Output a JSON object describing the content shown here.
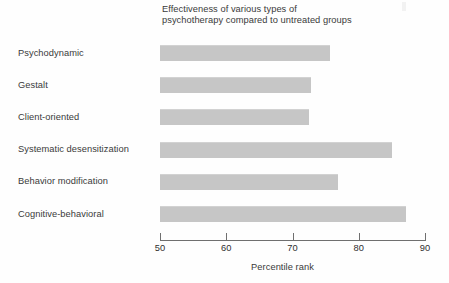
{
  "chart_data": {
    "type": "bar",
    "orientation": "horizontal",
    "title": "Effectiveness of various types of psychotherapy compared to untreated groups",
    "title_line1": "Effectiveness of various types of",
    "title_line2": "psychotherapy compared to untreated groups",
    "xlabel": "Percentile rank",
    "ylabel": "",
    "xlim": [
      50,
      90
    ],
    "xticks": [
      50,
      60,
      70,
      80,
      90
    ],
    "xtick_labels": [
      "50",
      "60",
      "70",
      "80",
      "90"
    ],
    "grid": false,
    "legend": false,
    "bar_color": "#c6c6c6",
    "categories": [
      "Psychodynamic",
      "Gestalt",
      "Client-oriented",
      "Systematic desensitization",
      "Behavior modification",
      "Cognitive-behavioral"
    ],
    "values": [
      75.7,
      72.8,
      72.5,
      85.0,
      76.9,
      87.1
    ],
    "bars": [
      {
        "label": "Psychodynamic",
        "value": 75.7
      },
      {
        "label": "Gestalt",
        "value": 72.8
      },
      {
        "label": "Client-oriented",
        "value": 72.5
      },
      {
        "label": "Systematic desensitization",
        "value": 85.0
      },
      {
        "label": "Behavior modification",
        "value": 76.9
      },
      {
        "label": "Cognitive-behavioral",
        "value": 87.1
      }
    ]
  }
}
